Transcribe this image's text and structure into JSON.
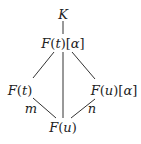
{
  "diagram": {
    "type": "field-extension-lattice",
    "nodes": [
      {
        "id": "K",
        "label": "K",
        "x": 63,
        "y": 14
      },
      {
        "id": "Ft_alpha",
        "label": "F(t)[α]",
        "x": 63,
        "y": 43
      },
      {
        "id": "Ft",
        "label": "F(t)",
        "x": 20,
        "y": 90
      },
      {
        "id": "Fu_alpha",
        "label": "F(u)[α]",
        "x": 114,
        "y": 90
      },
      {
        "id": "Fu",
        "label": "F(u)",
        "x": 63,
        "y": 127
      }
    ],
    "edges": [
      {
        "from": "K",
        "to": "Ft_alpha",
        "label": ""
      },
      {
        "from": "Ft_alpha",
        "to": "Ft",
        "label": ""
      },
      {
        "from": "Ft_alpha",
        "to": "Fu",
        "label": ""
      },
      {
        "from": "Ft_alpha",
        "to": "Fu_alpha",
        "label": ""
      },
      {
        "from": "Ft",
        "to": "Fu",
        "label": "m"
      },
      {
        "from": "Fu_alpha",
        "to": "Fu",
        "label": "n"
      }
    ],
    "edge_labels": {
      "m": "m",
      "n": "n"
    },
    "colors": {
      "line": "#333333",
      "text": "#222222",
      "background": "#ffffff"
    }
  }
}
